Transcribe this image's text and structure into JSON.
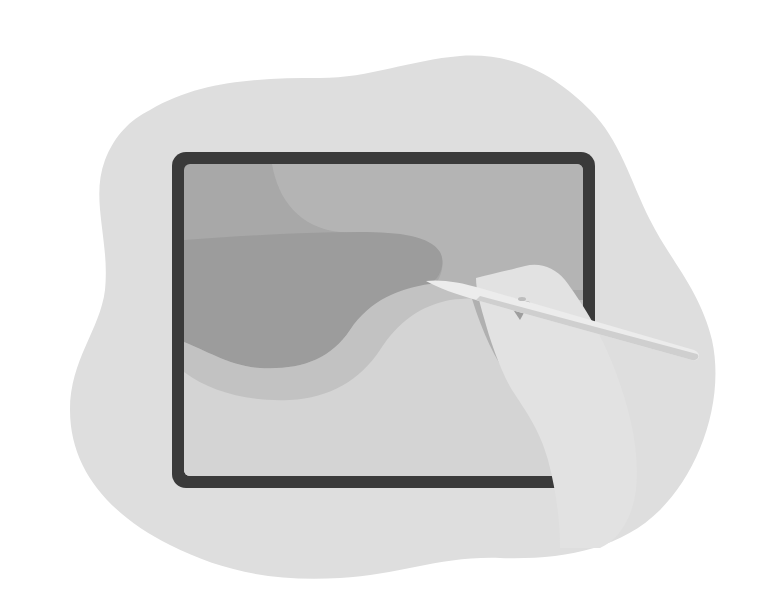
{
  "illustration": {
    "subject": "hand drawing on tablet with stylus",
    "colors": {
      "page_background": "#ffffff",
      "blob": "#dedede",
      "frame": "#3a3a3a",
      "screen_top": "#a8a8a8",
      "screen_light_shape": "#b8b8b8",
      "screen_dark_wave": "#9a9a9a",
      "screen_mid_wave": "#c4c4c4",
      "screen_bottom": "#d4d4d4",
      "hand": "#e2e2e2",
      "hand_shadow": "#b2b2b2",
      "stylus": "#ececec",
      "stylus_shade": "#cfcfcf"
    }
  }
}
